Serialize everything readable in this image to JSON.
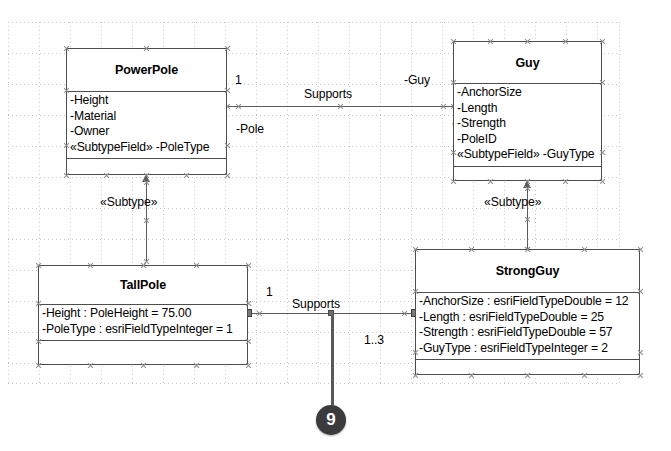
{
  "diagram": {
    "background_color": "#ffffff",
    "grid_color": "#c7c7cd",
    "line_color": "#5a5a5a",
    "box_border_color": "#4d4d4d"
  },
  "classes": [
    {
      "id": "powerpole",
      "name": "PowerPole",
      "attributes": [
        "-Height",
        "-Material",
        "-Owner",
        "«SubtypeField» -PoleType"
      ],
      "operations": []
    },
    {
      "id": "guy",
      "name": "Guy",
      "attributes": [
        "-AnchorSize",
        "-Length",
        "-Strength",
        "-PoleID",
        "«SubtypeField» -GuyType"
      ],
      "operations": []
    },
    {
      "id": "tallpole",
      "name": "TallPole",
      "attributes": [
        "-Height : PoleHeight = 75.00",
        "-PoleType : esriFieldTypeInteger = 1"
      ],
      "operations": []
    },
    {
      "id": "strongguy",
      "name": "StrongGuy",
      "attributes": [
        "-AnchorSize : esriFieldTypeDouble = 12",
        "-Length : esriFieldTypeDouble = 25",
        "-Strength : esriFieldTypeDouble = 57",
        "-GuyType : esriFieldTypeInteger = 2"
      ],
      "operations": []
    }
  ],
  "associations": [
    {
      "id": "powerpole-guy",
      "name": "Supports",
      "source_role": "-Pole",
      "source_multiplicity": "1",
      "target_role": "-Guy",
      "target_multiplicity": "*"
    },
    {
      "id": "tallpole-strongguy",
      "name": "Supports",
      "source_multiplicity": "1",
      "target_multiplicity": "1..3"
    }
  ],
  "generalizations": [
    {
      "id": "tallpole-powerpole",
      "stereotype": "«Subtype»"
    },
    {
      "id": "strongguy-guy",
      "stereotype": "«Subtype»"
    }
  ],
  "callouts": [
    {
      "id": "callout-9",
      "number": "9"
    }
  ]
}
